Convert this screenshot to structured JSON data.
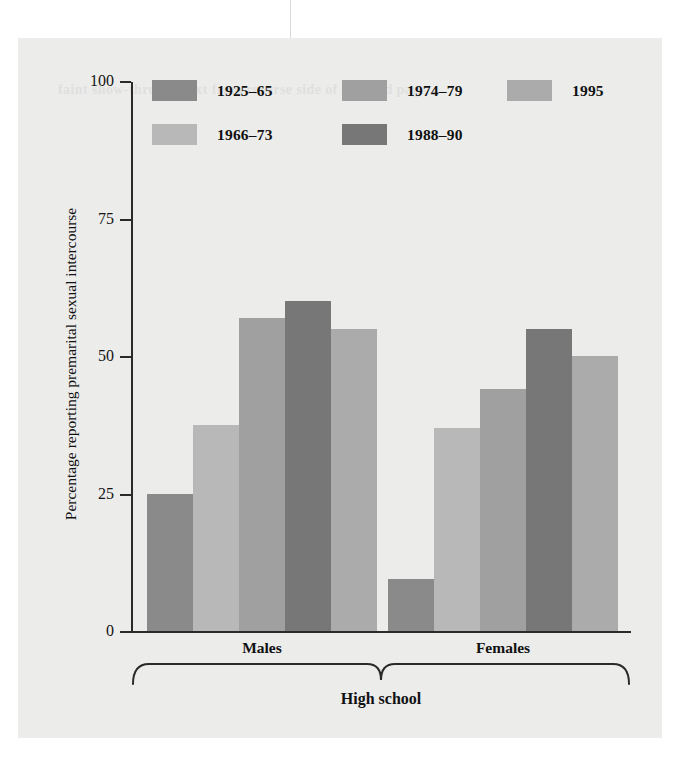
{
  "figure": {
    "background_color": "#ececeb",
    "axis_color": "#2a2a2a"
  },
  "legend": {
    "position": "top-left-inside",
    "entries": [
      {
        "label": "1925–65",
        "color": "#8a8a8a",
        "row": 0,
        "col": 0
      },
      {
        "label": "1974–79",
        "color": "#a0a0a0",
        "row": 0,
        "col": 1
      },
      {
        "label": "1995",
        "color": "#ababab",
        "row": 0,
        "col": 2
      },
      {
        "label": "1966–73",
        "color": "#b8b8b8",
        "row": 1,
        "col": 0
      },
      {
        "label": "1988–90",
        "color": "#777777",
        "row": 1,
        "col": 1
      }
    ]
  },
  "axes": {
    "y_title": "Percentage reporting premarital sexual intercourse",
    "y_ticks": [
      "0",
      "25",
      "50",
      "75",
      "100"
    ],
    "x_group_labels": [
      "Males",
      "Females"
    ],
    "bracket_label": "High school"
  },
  "chart_data": {
    "type": "bar",
    "title": "",
    "xlabel": "High school",
    "ylabel": "Percentage reporting premarital sexual intercourse",
    "ylim": [
      0,
      100
    ],
    "yticks": [
      0,
      25,
      50,
      75,
      100
    ],
    "grid": false,
    "legend_position": "upper left (inside axes)",
    "categories": [
      "Males",
      "Females"
    ],
    "series": [
      {
        "name": "1925–65",
        "color": "#8a8a8a",
        "values": [
          25,
          9.5
        ]
      },
      {
        "name": "1966–73",
        "color": "#b8b8b8",
        "values": [
          37.5,
          37
        ]
      },
      {
        "name": "1974–79",
        "color": "#a0a0a0",
        "values": [
          57,
          44
        ]
      },
      {
        "name": "1988–90",
        "color": "#777777",
        "values": [
          60,
          55
        ]
      },
      {
        "name": "1995",
        "color": "#ababab",
        "values": [
          55,
          50
        ]
      }
    ]
  },
  "ghost_text": "faint show-through text from reverse side of scanned page"
}
